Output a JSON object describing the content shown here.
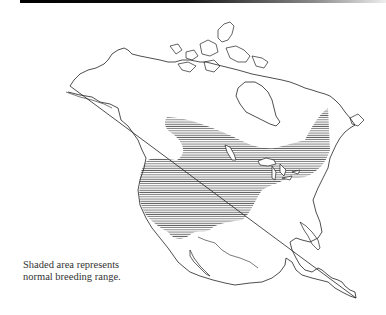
{
  "map": {
    "title": "North America breeding range map",
    "legend": {
      "line1": "Shaded area represents",
      "line2": "normal breeding range."
    },
    "colors": {
      "outline": "#222222",
      "hatch": "#555555",
      "background": "#ffffff",
      "top_bar": "#000000"
    }
  }
}
